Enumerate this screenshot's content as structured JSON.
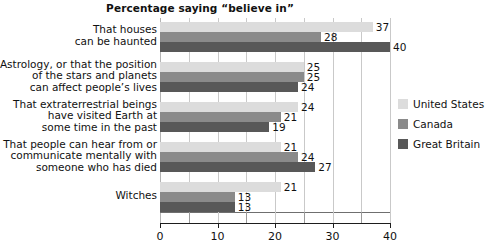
{
  "chart_data": {
    "type": "bar",
    "orientation": "horizontal",
    "title": "Percentage saying “believe in”",
    "xlabel": "",
    "ylabel": "",
    "xlim": [
      0,
      40
    ],
    "xticks": [
      0,
      10,
      20,
      30,
      40
    ],
    "xtick_labels": [
      "0",
      "10",
      "20",
      "30",
      "40"
    ],
    "xticks_minor": [
      5,
      15,
      25,
      35
    ],
    "grid": true,
    "legend_position": "right",
    "categories": [
      [
        "That houses",
        "can be haunted"
      ],
      [
        "Astrology, or that the position",
        "of the stars and planets",
        "can affect people’s lives"
      ],
      [
        "That extraterrestrial beings",
        "have visited Earth at",
        "some time in the past"
      ],
      [
        "That people can hear from or",
        "communicate mentally with",
        "someone who has died"
      ],
      [
        "Witches"
      ]
    ],
    "series": [
      {
        "name": "United States",
        "color": "#dcdcdc",
        "values": [
          37,
          25,
          24,
          21,
          21
        ]
      },
      {
        "name": "Canada",
        "color": "#8a8a8a",
        "values": [
          28,
          25,
          21,
          24,
          13
        ]
      },
      {
        "name": "Great Britain",
        "color": "#585858",
        "values": [
          40,
          24,
          19,
          27,
          13
        ]
      }
    ]
  }
}
